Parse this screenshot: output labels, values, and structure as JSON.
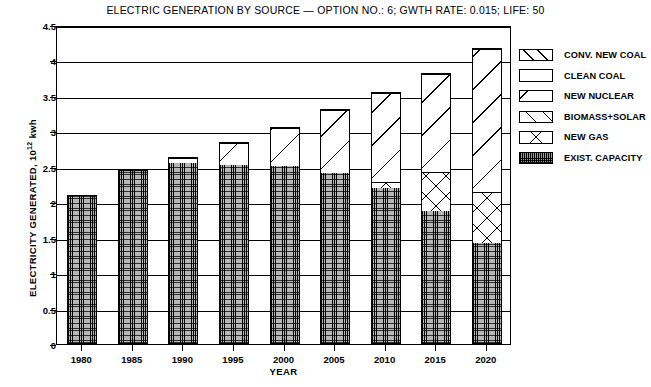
{
  "chart_data": {
    "type": "bar",
    "title": "ELECTRIC GENERATION BY SOURCE — OPTION NO.: 6; GWTH RATE: 0.015; LIFE: 50",
    "xlabel": "YEAR",
    "ylabel_text": "ELECTRICITY GENERATED, 10",
    "ylabel_exponent": "12",
    "ylabel_unit": " kwh",
    "categories": [
      "1980",
      "1985",
      "1990",
      "1995",
      "2000",
      "2005",
      "2010",
      "2015",
      "2020"
    ],
    "ylim": [
      0,
      4.5
    ],
    "yticks": [
      "0",
      "0.5",
      "1",
      "1.5",
      "2",
      "2.5",
      "3",
      "3.5",
      "4",
      "4.5"
    ],
    "grid": true,
    "legend_position": "right-outside",
    "stacked": true,
    "series": [
      {
        "name": "EXIST. CAPACITY",
        "key": "exist",
        "values": [
          2.1,
          2.46,
          2.56,
          2.53,
          2.52,
          2.42,
          2.21,
          1.87,
          1.42
        ]
      },
      {
        "name": "NEW GAS",
        "key": "gas",
        "values": [
          0.0,
          0.0,
          0.0,
          0.0,
          0.0,
          0.0,
          0.08,
          0.56,
          0.72
        ]
      },
      {
        "name": "BIOMASS+SOLAR",
        "key": "bio",
        "values": [
          0.0,
          0.0,
          0.0,
          0.0,
          0.0,
          0.0,
          0.0,
          0.0,
          0.0
        ]
      },
      {
        "name": "NEW NUCLEAR",
        "key": "nuc",
        "values": [
          0.0,
          0.0,
          0.08,
          0.32,
          0.54,
          0.89,
          1.26,
          1.4,
          2.04
        ]
      },
      {
        "name": "CLEAN COAL",
        "key": "clean",
        "values": [
          0.0,
          0.0,
          0.0,
          0.0,
          0.0,
          0.0,
          0.0,
          0.0,
          0.0
        ]
      },
      {
        "name": "CONV. NEW COAL",
        "key": "conv",
        "values": [
          0.0,
          0.0,
          0.0,
          0.0,
          0.0,
          0.0,
          0.0,
          0.0,
          0.0
        ]
      }
    ],
    "totals": [
      2.1,
      2.46,
      2.64,
      2.85,
      3.06,
      3.31,
      3.55,
      3.83,
      4.18
    ]
  },
  "legend": {
    "items": [
      {
        "label": "CONV. NEW COAL",
        "pattern": "diagonal-hatch-up"
      },
      {
        "label": "CLEAN COAL",
        "pattern": "single-diagonal-down"
      },
      {
        "label": "NEW NUCLEAR",
        "pattern": "diagonal-hatch-down"
      },
      {
        "label": "BIOMASS+SOLAR",
        "pattern": "diagonal-hatch-up-dense"
      },
      {
        "label": "NEW GAS",
        "pattern": "cross-hatch"
      },
      {
        "label": "EXIST. CAPACITY",
        "pattern": "dense-dot-fill"
      }
    ]
  }
}
